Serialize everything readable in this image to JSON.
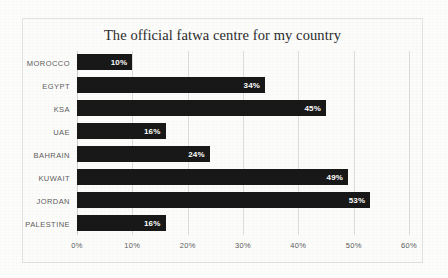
{
  "chart_data": {
    "type": "bar",
    "orientation": "horizontal",
    "title": "The official fatwa centre for my country",
    "xlabel": "",
    "ylabel": "",
    "categories": [
      "MOROCCO",
      "EGYPT",
      "KSA",
      "UAE",
      "BAHRAIN",
      "KUWAIT",
      "JORDAN",
      "PALESTINE"
    ],
    "values": [
      10,
      34,
      45,
      16,
      24,
      49,
      53,
      16
    ],
    "data_labels": [
      "10%",
      "34%",
      "45%",
      "16%",
      "24%",
      "49%",
      "53%",
      "16%"
    ],
    "xlim": [
      0,
      60
    ],
    "xticks": [
      0,
      10,
      20,
      30,
      40,
      50,
      60
    ],
    "xtick_labels": [
      "0%",
      "10%",
      "20%",
      "30%",
      "40%",
      "50%",
      "60%"
    ],
    "grid": true,
    "grid_axis": "x",
    "legend": false,
    "bar_color": "#181818",
    "data_label_color": "#ffffff",
    "axis_text_color": "#5c5c5c",
    "plot_background": "#fcfcfb",
    "border_color": "#e2e2e0"
  }
}
